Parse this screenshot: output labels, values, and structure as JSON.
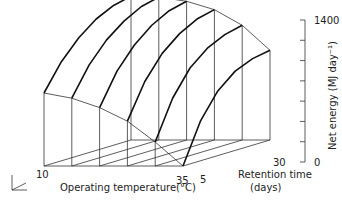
{
  "chart_data": {
    "type": "surface3d",
    "title": "",
    "x_axis": {
      "label": "Operating temperature(°C)",
      "ticks": [
        "10",
        "35"
      ],
      "values": [
        10,
        15,
        20,
        25,
        30,
        35
      ]
    },
    "y_axis": {
      "label": "Retention time (days)",
      "label_line1": "Retention time",
      "label_line2": "(days)",
      "ticks": [
        "5",
        "30"
      ],
      "values": [
        5,
        10,
        15,
        20,
        25,
        30
      ]
    },
    "z_axis": {
      "label": "Net energy (MJ day⁻¹)",
      "ticks": [
        "0",
        "1400"
      ],
      "range": [
        0,
        1400
      ],
      "minor_tick_step": 200
    },
    "series": [
      {
        "name": "T=10°C",
        "retention_days": [
          5,
          10,
          15,
          20,
          25,
          30
        ],
        "net_energy": [
          700,
          950,
          1130,
          1260,
          1340,
          1380
        ]
      },
      {
        "name": "T=15°C",
        "retention_days": [
          5,
          10,
          15,
          20,
          25,
          30
        ],
        "net_energy": [
          650,
          920,
          1110,
          1240,
          1330,
          1370
        ]
      },
      {
        "name": "T=20°C",
        "retention_days": [
          5,
          10,
          15,
          20,
          25,
          30
        ],
        "net_energy": [
          560,
          860,
          1060,
          1200,
          1290,
          1330
        ]
      },
      {
        "name": "T=25°C",
        "retention_days": [
          5,
          10,
          15,
          20,
          25,
          30
        ],
        "net_energy": [
          430,
          760,
          980,
          1120,
          1210,
          1250
        ]
      },
      {
        "name": "T=30°C",
        "retention_days": [
          5,
          10,
          15,
          20,
          25,
          30
        ],
        "net_energy": [
          230,
          600,
          840,
          980,
          1060,
          1100
        ]
      },
      {
        "name": "T=35°C",
        "retention_days": [
          5,
          10,
          15,
          20,
          25,
          30
        ],
        "net_energy": [
          0,
          380,
          620,
          760,
          830,
          860
        ]
      }
    ],
    "front_edge_R5": [
      700,
      650,
      560,
      430,
      230,
      0
    ],
    "back_edge_R30": [
      1380,
      1370,
      1330,
      1250,
      1100,
      860
    ],
    "grid": false,
    "legend": null
  },
  "labels": {
    "x_axis_label": "Operating temperature(°C)",
    "x_tick_min": "10",
    "x_tick_max": "35",
    "y_axis_label_1": "Retention time",
    "y_axis_label_2": "(days)",
    "y_tick_min": "5",
    "y_tick_max": "30",
    "z_axis_label": "Net energy (MJ day⁻¹)",
    "z_tick_min": "0",
    "z_tick_max": "1400"
  }
}
